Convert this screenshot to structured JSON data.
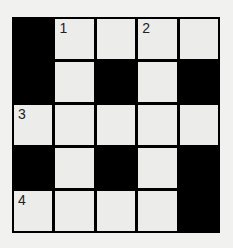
{
  "crossword": {
    "rows": 5,
    "cols": 5,
    "cells": [
      [
        {
          "black": true
        },
        {
          "num": "1"
        },
        {},
        {
          "num": "2"
        },
        {}
      ],
      [
        {
          "black": true
        },
        {},
        {
          "black": true
        },
        {},
        {
          "black": true
        }
      ],
      [
        {
          "num": "3"
        },
        {},
        {},
        {},
        {}
      ],
      [
        {
          "black": true
        },
        {},
        {
          "black": true
        },
        {},
        {
          "black": true
        }
      ],
      [
        {
          "num": "4"
        },
        {},
        {},
        {},
        {
          "black": true
        }
      ]
    ]
  }
}
